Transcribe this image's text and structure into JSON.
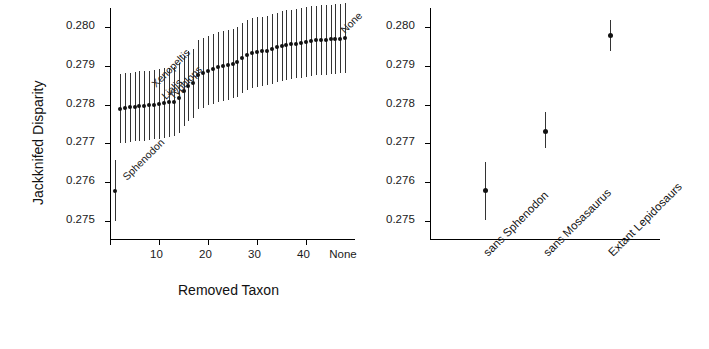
{
  "figure": {
    "background": "#ffffff",
    "point_color": "#111111",
    "line_color": "#333333"
  },
  "chart_data": [
    {
      "type": "scatter",
      "panel": "left",
      "title": "",
      "xlabel": "Removed Taxon",
      "ylabel": "Jackknifed Disparity",
      "xlim": [
        0,
        50
      ],
      "ylim": [
        0.2745,
        0.2805
      ],
      "xticks": [
        0,
        10,
        20,
        30,
        40
      ],
      "xticklabels": [
        "0",
        "10",
        "20",
        "30",
        "40"
      ],
      "extra_xticklabel": "None",
      "yticks": [
        0.275,
        0.276,
        0.277,
        0.278,
        0.279,
        0.28
      ],
      "yticklabels": [
        "0.275",
        "0.276",
        "0.277",
        "0.278",
        "0.279",
        "0.280"
      ],
      "grid": false,
      "legend": false,
      "annotations": [
        {
          "text": "Sphenodon",
          "x": 2,
          "y": 0.2762,
          "rotation": -45
        },
        {
          "text": "Xenopeltis",
          "x": 8,
          "y": 0.2786,
          "rotation": -45
        },
        {
          "text": "Lialis",
          "x": 10,
          "y": 0.2783,
          "rotation": -45
        },
        {
          "text": "Typhlops",
          "x": 11.5,
          "y": 0.2783,
          "rotation": -45
        },
        {
          "text": "None",
          "x": 46.5,
          "y": 0.28,
          "rotation": -45
        }
      ],
      "x": [
        1,
        2,
        3,
        4,
        5,
        6,
        7,
        8,
        9,
        10,
        11,
        12,
        13,
        14,
        15,
        16,
        17,
        18,
        19,
        20,
        21,
        22,
        23,
        24,
        25,
        26,
        27,
        28,
        29,
        30,
        31,
        32,
        33,
        34,
        35,
        36,
        37,
        38,
        39,
        40,
        41,
        42,
        43,
        44,
        45,
        46,
        47,
        48
      ],
      "y": [
        0.27578,
        0.2779,
        0.27792,
        0.27793,
        0.27795,
        0.27796,
        0.27797,
        0.27798,
        0.278,
        0.27802,
        0.27804,
        0.27806,
        0.27808,
        0.27818,
        0.27836,
        0.27848,
        0.27855,
        0.27878,
        0.27882,
        0.27888,
        0.27893,
        0.27897,
        0.279,
        0.27903,
        0.27906,
        0.2791,
        0.2792,
        0.27928,
        0.27934,
        0.27936,
        0.27938,
        0.2794,
        0.27944,
        0.27948,
        0.27952,
        0.27954,
        0.27956,
        0.27958,
        0.2796,
        0.27962,
        0.27964,
        0.27966,
        0.27967,
        0.27968,
        0.27969,
        0.2797,
        0.27971,
        0.27972
      ],
      "yerr_low": [
        0.27498,
        0.277,
        0.27702,
        0.27703,
        0.27705,
        0.27706,
        0.27707,
        0.27708,
        0.2771,
        0.27712,
        0.27714,
        0.27716,
        0.27718,
        0.27728,
        0.27746,
        0.27758,
        0.27765,
        0.27788,
        0.27792,
        0.27798,
        0.27803,
        0.27807,
        0.2781,
        0.27813,
        0.27816,
        0.2782,
        0.2783,
        0.27838,
        0.27844,
        0.27846,
        0.27848,
        0.2785,
        0.27854,
        0.27858,
        0.27862,
        0.27864,
        0.27866,
        0.27868,
        0.2787,
        0.27872,
        0.27874,
        0.27876,
        0.27877,
        0.27878,
        0.27879,
        0.2788,
        0.27881,
        0.27882
      ],
      "yerr_high": [
        0.27658,
        0.2788,
        0.27882,
        0.27883,
        0.27885,
        0.27886,
        0.27887,
        0.27888,
        0.2789,
        0.27892,
        0.27894,
        0.27896,
        0.27898,
        0.27908,
        0.27926,
        0.27938,
        0.27945,
        0.27968,
        0.27972,
        0.27978,
        0.27983,
        0.27987,
        0.2799,
        0.27993,
        0.27996,
        0.28,
        0.2801,
        0.28018,
        0.28024,
        0.28026,
        0.28028,
        0.2803,
        0.28034,
        0.28038,
        0.28042,
        0.28044,
        0.28046,
        0.28048,
        0.2805,
        0.28052,
        0.28054,
        0.28056,
        0.28057,
        0.28058,
        0.28059,
        0.2806,
        0.28061,
        0.28062
      ]
    },
    {
      "type": "scatter",
      "panel": "right",
      "title": "",
      "xlabel": "",
      "ylabel": "",
      "ylim": [
        0.2745,
        0.2805
      ],
      "yticks": [
        0.275,
        0.276,
        0.277,
        0.278,
        0.279,
        0.28
      ],
      "yticklabels": [
        "0.275",
        "0.276",
        "0.277",
        "0.278",
        "0.279",
        "0.280"
      ],
      "grid": false,
      "legend": false,
      "categories": [
        "sans Sphenodon",
        "sans Mosasaurus",
        "Extant Lepidosaurs"
      ],
      "values": [
        0.27578,
        0.2773,
        0.27978
      ],
      "yerr_low": [
        0.27502,
        0.27688,
        0.27938
      ],
      "yerr_high": [
        0.27652,
        0.2778,
        0.28018
      ]
    }
  ]
}
